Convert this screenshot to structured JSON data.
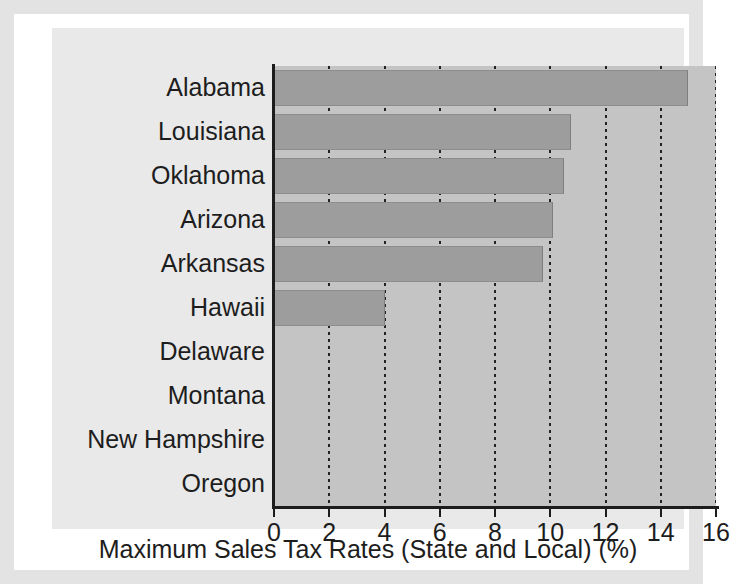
{
  "chart_data": {
    "type": "bar",
    "orientation": "horizontal",
    "title": "",
    "xlabel": "Maximum Sales Tax Rates (State and Local) (%)",
    "ylabel": "",
    "categories": [
      "Alabama",
      "Louisiana",
      "Oklahoma",
      "Arizona",
      "Arkansas",
      "Hawaii",
      "Delaware",
      "Montana",
      "New Hampshire",
      "Oregon"
    ],
    "values": [
      15.0,
      10.75,
      10.5,
      10.1,
      9.75,
      4.0,
      0,
      0,
      0,
      0
    ],
    "xlim": [
      0,
      16
    ],
    "xticks": [
      0,
      2,
      4,
      6,
      8,
      10,
      12,
      14,
      16
    ],
    "xtick_labels": [
      "0",
      "2",
      "4",
      "6",
      "8",
      "10",
      "12",
      "14",
      "16"
    ],
    "grid": true,
    "grid_axis": "x",
    "grid_style": "dotted",
    "legend": false,
    "bar_color": "#9d9d9d",
    "plot_background": "#c4c4c4",
    "panel_background": "#e9e9e9",
    "axis_color": "#1c1c1c",
    "text_color": "#1d1d1d"
  }
}
